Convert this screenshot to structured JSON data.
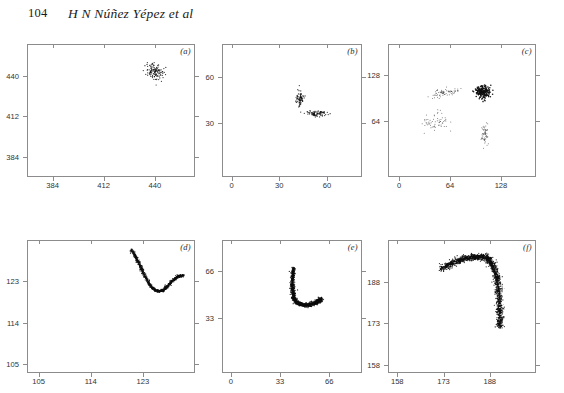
{
  "header": {
    "folio": "104",
    "authors": "H N Núñez Yépez et al"
  },
  "figure": {
    "panels": [
      {
        "id": "a",
        "label": "(a)",
        "xticks": [
          "384",
          "412",
          "440"
        ],
        "yticks": [
          "440",
          "412",
          "384"
        ],
        "xlim": [
          370,
          462
        ],
        "ylim": [
          370,
          462
        ]
      },
      {
        "id": "b",
        "label": "(b)",
        "xticks": [
          "0",
          "30",
          "60"
        ],
        "yticks": [
          "60",
          "30"
        ],
        "xlim": [
          -6,
          82
        ],
        "ylim": [
          -6,
          82
        ]
      },
      {
        "id": "c",
        "label": "(c)",
        "xticks": [
          "0",
          "64",
          "128"
        ],
        "yticks": [
          "128",
          "64"
        ],
        "xlim": [
          -14,
          172
        ],
        "ylim": [
          -14,
          172
        ]
      },
      {
        "id": "d",
        "label": "(d)",
        "xticks": [
          "105",
          "114",
          "123"
        ],
        "yticks": [
          "123",
          "114",
          "105"
        ],
        "xlim": [
          103,
          132
        ],
        "ylim": [
          103,
          132
        ]
      },
      {
        "id": "e",
        "label": "(e)",
        "xticks": [
          "0",
          "33",
          "66"
        ],
        "yticks": [
          "66",
          "33"
        ],
        "xlim": [
          -6,
          88
        ],
        "ylim": [
          -6,
          88
        ]
      },
      {
        "id": "f",
        "label": "(f)",
        "xticks": [
          "158",
          "173",
          "188"
        ],
        "yticks": [
          "188",
          "173",
          "158"
        ],
        "xlim": [
          155,
          203
        ],
        "ylim": [
          155,
          203
        ]
      }
    ]
  },
  "chart_data": [
    {
      "type": "scatter",
      "panel": "(a)",
      "title": "",
      "xlabel": "",
      "ylabel": "",
      "xlim": [
        370,
        462
      ],
      "ylim": [
        370,
        462
      ],
      "xticks": [
        384,
        412,
        440
      ],
      "yticks": [
        384,
        412,
        440
      ],
      "grid": false,
      "legend": null,
      "description": "single small elongated diagonal cluster near upper middle",
      "clusters": [
        {
          "cx": 440,
          "cy": 443,
          "rx": 2.2,
          "ry": 3.4,
          "angle": 35,
          "n": 120,
          "density": "dense"
        }
      ]
    },
    {
      "type": "scatter",
      "panel": "(b)",
      "title": "",
      "xlabel": "",
      "ylabel": "",
      "xlim": [
        -6,
        82
      ],
      "ylim": [
        -6,
        82
      ],
      "xticks": [
        0,
        30,
        60
      ],
      "yticks": [
        30,
        60
      ],
      "grid": false,
      "legend": null,
      "description": "two small blobs: a vertical speck and a horizontal dash below-right",
      "clusters": [
        {
          "cx": 43,
          "cy": 46,
          "rx": 1.3,
          "ry": 2.6,
          "angle": 0,
          "n": 70,
          "density": "dense"
        },
        {
          "cx": 53,
          "cy": 36,
          "rx": 3.4,
          "ry": 0.9,
          "angle": 0,
          "n": 80,
          "density": "dense"
        }
      ]
    },
    {
      "type": "scatter",
      "panel": "(c)",
      "title": "",
      "xlabel": "",
      "ylabel": "",
      "xlim": [
        -14,
        172
      ],
      "ylim": [
        -14,
        172
      ],
      "xticks": [
        0,
        64,
        128
      ],
      "yticks": [
        64,
        128
      ],
      "grid": false,
      "legend": null,
      "description": "four scattered clusters: two streaks upper-left/lower-left, one dense blob upper-right, one small vertical wisp lower-right",
      "clusters": [
        {
          "cx": 57,
          "cy": 104,
          "rx": 9,
          "ry": 3,
          "angle": 12,
          "n": 70,
          "density": "sparse"
        },
        {
          "cx": 105,
          "cy": 105,
          "rx": 5,
          "ry": 4.5,
          "angle": 0,
          "n": 180,
          "density": "very-dense"
        },
        {
          "cx": 46,
          "cy": 63,
          "rx": 8,
          "ry": 7,
          "angle": -45,
          "n": 60,
          "density": "sparse"
        },
        {
          "cx": 108,
          "cy": 45,
          "rx": 2,
          "ry": 7,
          "angle": 0,
          "n": 55,
          "density": "sparse"
        }
      ]
    },
    {
      "type": "scatter",
      "panel": "(d)",
      "title": "",
      "xlabel": "",
      "ylabel": "",
      "xlim": [
        103,
        132
      ],
      "ylim": [
        103,
        132
      ],
      "xticks": [
        105,
        114,
        123
      ],
      "yticks": [
        105,
        114,
        123
      ],
      "grid": false,
      "legend": null,
      "description": "dense V / U-shaped dotted curve occupying upper right quadrant, descending from upper-left then rising to the right",
      "curve": {
        "x": [
          121.0,
          121.6,
          122.2,
          122.8,
          123.4,
          124.0,
          124.6,
          125.2,
          125.8,
          126.4,
          127.0,
          127.6,
          128.2,
          128.8,
          129.4,
          130.0
        ],
        "y": [
          130.0,
          128.6,
          127.2,
          125.6,
          124.0,
          122.6,
          121.6,
          121.0,
          120.8,
          121.0,
          121.6,
          122.4,
          123.2,
          123.8,
          124.2,
          124.2
        ],
        "n_points": 900,
        "jitter": 0.35
      }
    },
    {
      "type": "scatter",
      "panel": "(e)",
      "title": "",
      "xlabel": "",
      "ylabel": "",
      "xlim": [
        -6,
        88
      ],
      "ylim": [
        -6,
        88
      ],
      "xticks": [
        0,
        33,
        66
      ],
      "yticks": [
        33,
        66
      ],
      "grid": false,
      "legend": null,
      "description": "dense vertical stroke near x=42 with a curved tail sweeping right and up, J/hook shaped cloud",
      "curve": {
        "x": [
          42.0,
          41.5,
          41.2,
          41.5,
          42.5,
          44.0,
          46.0,
          48.5,
          51.0,
          53.5,
          56.0,
          58.0,
          59.5,
          60.5
        ],
        "y": [
          68.0,
          63.0,
          57.0,
          51.0,
          46.5,
          44.0,
          42.8,
          42.2,
          42.0,
          42.4,
          43.2,
          44.4,
          45.6,
          46.4
        ],
        "n_points": 1400,
        "jitter": 1.6
      }
    },
    {
      "type": "scatter",
      "panel": "(f)",
      "title": "",
      "xlabel": "",
      "ylabel": "",
      "xlim": [
        155,
        203
      ],
      "ylim": [
        155,
        203
      ],
      "xticks": [
        158,
        173,
        188
      ],
      "yticks": [
        158,
        173,
        188
      ],
      "grid": false,
      "legend": null,
      "description": "arc rising from left, peaking near x=186, then curving down into a dense scattered vertical cloud on the right",
      "curve": {
        "x": [
          172.0,
          174.5,
          177.0,
          179.5,
          182.0,
          184.5,
          186.5,
          188.0,
          189.2,
          190.0,
          190.6,
          191.0,
          191.2,
          191.3,
          191.4
        ],
        "y": [
          192.5,
          194.0,
          195.2,
          196.2,
          196.8,
          197.0,
          196.8,
          195.6,
          193.5,
          190.5,
          187.0,
          183.0,
          179.0,
          175.0,
          171.5
        ],
        "n_points": 1600,
        "jitter": 1.5
      }
    }
  ]
}
